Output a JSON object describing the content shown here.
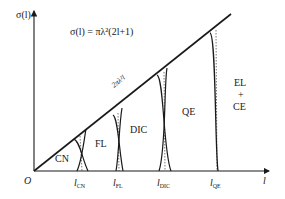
{
  "diagram": {
    "y_axis_label": "σ(l)",
    "x_axis_label": "l",
    "origin_label": "O",
    "formula": "σ(l) = πλ²(2l+1)",
    "line_label": "2πλ²l",
    "regions": [
      {
        "label": "CN"
      },
      {
        "label": "FL"
      },
      {
        "label": "DIC"
      },
      {
        "label": "QE"
      },
      {
        "label_line1": "EL",
        "label_line2": "+",
        "label_line3": "CE"
      }
    ],
    "x_ticks": [
      {
        "main": "l",
        "sub": "CN"
      },
      {
        "main": "l",
        "sub": "FL"
      },
      {
        "main": "l",
        "sub": "DIC"
      },
      {
        "main": "l",
        "sub": "QE"
      }
    ],
    "colors": {
      "ink": "#1a1a1a",
      "background": "#ffffff"
    }
  }
}
